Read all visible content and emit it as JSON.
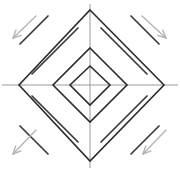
{
  "figure": {
    "width": 180,
    "height": 171,
    "background": "#ffffff",
    "center": {
      "x": 90,
      "y": 85
    },
    "colors": {
      "diamond_stroke": "#2b2b2b",
      "axis_stroke": "#9a9a9a",
      "hatch_stroke": "#3a3a3a",
      "arrow_stroke": "#b5b5b5",
      "background": "#ffffff"
    },
    "axes": {
      "horizontal": {
        "x1": 2,
        "y1": 85,
        "x2": 178,
        "y2": 85,
        "width": 1
      },
      "vertical": {
        "x1": 90,
        "y1": 4,
        "x2": 90,
        "y2": 168,
        "width": 1
      }
    },
    "diamonds": [
      {
        "name": "outer-diamond",
        "top": {
          "x": 90,
          "y": 10
        },
        "right": {
          "x": 164,
          "y": 85
        },
        "bottom": {
          "x": 90,
          "y": 161
        },
        "left": {
          "x": 19,
          "y": 85
        },
        "stroke_width": 1.6
      },
      {
        "name": "middle-diamond",
        "top": {
          "x": 90,
          "y": 48
        },
        "right": {
          "x": 127,
          "y": 85
        },
        "bottom": {
          "x": 90,
          "y": 122
        },
        "left": {
          "x": 53,
          "y": 85
        },
        "stroke_width": 1.6
      },
      {
        "name": "inner-diamond",
        "top": {
          "x": 90,
          "y": 66
        },
        "right": {
          "x": 110,
          "y": 85
        },
        "bottom": {
          "x": 90,
          "y": 105
        },
        "left": {
          "x": 70,
          "y": 85
        },
        "stroke_width": 1.6
      }
    ],
    "hatch_groups": [
      {
        "name": "hatch-group-top-left",
        "quadrant": "top-left",
        "direction": "down-left-to-up-right",
        "lines": [
          {
            "x1": 20,
            "y1": 44,
            "x2": 48,
            "y2": 16
          },
          {
            "x1": 32,
            "y1": 74,
            "x2": 78,
            "y2": 28
          }
        ]
      },
      {
        "name": "hatch-group-top-right",
        "quadrant": "top-right",
        "direction": "up-left-to-down-right",
        "lines": [
          {
            "x1": 131,
            "y1": 16,
            "x2": 159,
            "y2": 44
          },
          {
            "x1": 101,
            "y1": 28,
            "x2": 147,
            "y2": 74
          }
        ]
      },
      {
        "name": "hatch-group-bottom-left",
        "quadrant": "bottom-left",
        "direction": "up-left-to-down-right",
        "lines": [
          {
            "x1": 20,
            "y1": 126,
            "x2": 48,
            "y2": 154
          },
          {
            "x1": 32,
            "y1": 96,
            "x2": 78,
            "y2": 142
          }
        ]
      },
      {
        "name": "hatch-group-bottom-right",
        "quadrant": "bottom-right",
        "direction": "down-left-to-up-right",
        "lines": [
          {
            "x1": 131,
            "y1": 154,
            "x2": 159,
            "y2": 126
          },
          {
            "x1": 101,
            "y1": 142,
            "x2": 147,
            "y2": 96
          }
        ]
      }
    ],
    "arrows": [
      {
        "name": "arrow-top-left",
        "quadrant": "top-left",
        "points_toward": "down-left",
        "tail": {
          "x": 36,
          "y": 16
        },
        "tip": {
          "x": 13,
          "y": 38
        }
      },
      {
        "name": "arrow-top-right",
        "quadrant": "top-right",
        "points_toward": "down-right",
        "tail": {
          "x": 142,
          "y": 16
        },
        "tip": {
          "x": 166,
          "y": 38
        }
      },
      {
        "name": "arrow-bottom-left",
        "quadrant": "bottom-left",
        "points_toward": "down-left",
        "tail": {
          "x": 36,
          "y": 130
        },
        "tip": {
          "x": 13,
          "y": 154
        }
      },
      {
        "name": "arrow-bottom-right",
        "quadrant": "bottom-right",
        "points_toward": "down-left",
        "tail": {
          "x": 166,
          "y": 130
        },
        "tip": {
          "x": 143,
          "y": 154
        }
      }
    ]
  }
}
